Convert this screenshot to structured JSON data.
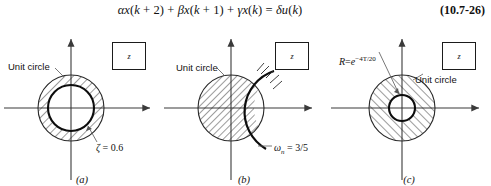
{
  "equation": {
    "text": "αx(k + 2) + βx(k + 1) + γx(k) = δu(k)",
    "number": "(10.7-26)"
  },
  "panels": [
    {
      "id": "a",
      "caption": "(a)",
      "plane_marker": "z",
      "unit_circle_label": "Unit circle",
      "annotation": "ζ = 0.6",
      "annotation_parts": {
        "symbol": "ζ",
        "relation": "=",
        "value": "0.6"
      },
      "region": "annulus between damping-ratio circle and unit circle (hatched)"
    },
    {
      "id": "b",
      "caption": "(b)",
      "plane_marker": "z",
      "unit_circle_label": "Unit circle",
      "annotation": "ωn = 3/5",
      "annotation_parts": {
        "symbol": "ω",
        "subscript": "n",
        "relation": "=",
        "value": "3/5"
      },
      "region": "lens between constant-frequency arc and unit circle (hatched)"
    },
    {
      "id": "c",
      "caption": "(c)",
      "plane_marker": "z",
      "unit_circle_label": "Unit circle",
      "annotation": "R = e-4T/20",
      "annotation_parts": {
        "symbol": "R",
        "relation": "=",
        "base": "e",
        "exponent": "−4T/20"
      },
      "region": "annulus between constant-radius circle and unit circle (hatched)"
    }
  ],
  "colors": {
    "ink": "#111111",
    "line": "#3a3a3a",
    "background": "#ffffff"
  }
}
